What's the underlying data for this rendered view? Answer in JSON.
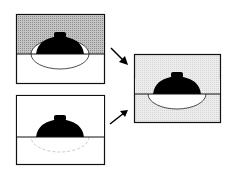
{
  "figure": {
    "panels": [
      {
        "id": "top-left",
        "background_top": "#b8b8b8",
        "background_bottom": "#ffffff",
        "lid": "black dome",
        "bowl": "solid outline"
      },
      {
        "id": "bottom-left",
        "background_top": "#ffffff",
        "background_bottom": "#ffffff",
        "lid": "black dome",
        "bowl": "faint dashed outline"
      },
      {
        "id": "right-result",
        "background_top": "#e6e6e6",
        "background_bottom": "#e6e6e6",
        "lid": "black dome",
        "bowl": "white filled with outline"
      }
    ],
    "arrows": [
      "top-left to right-result",
      "bottom-left to right-result"
    ],
    "colors": {
      "stroke": "#111111",
      "shade_dark": "#b5b5b5",
      "shade_light": "#e4e4e4"
    }
  }
}
